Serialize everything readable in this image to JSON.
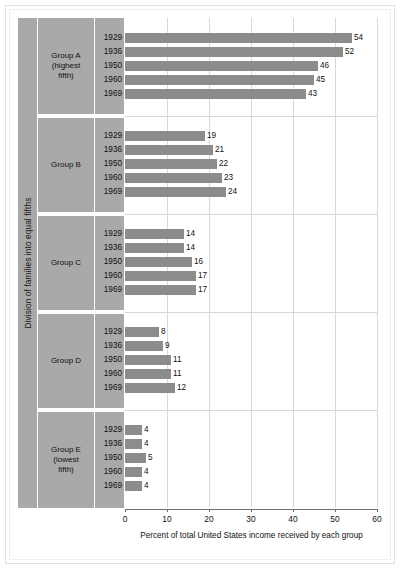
{
  "chart_data": {
    "type": "bar",
    "orientation": "horizontal",
    "title": "",
    "xlabel": "Percent of total United States income received by each group",
    "ylabel": "Division of families into equal fifths",
    "xlim": [
      0,
      60
    ],
    "xticks": [
      0,
      10,
      20,
      30,
      40,
      50,
      60
    ],
    "xtick_labels": [
      "0",
      "10",
      "20",
      "30",
      "40",
      "50",
      "60"
    ],
    "grid": true,
    "legend": "none",
    "bar_color": "#8c8c8c",
    "panel_color": "#a9a9a9",
    "groups": [
      {
        "name": "Group A (highest fifth)",
        "name_lines": [
          "Group A",
          "(highest",
          "fifth)"
        ],
        "categories": [
          "1929",
          "1936",
          "1950",
          "1960",
          "1969"
        ],
        "values": [
          54,
          52,
          46,
          45,
          43
        ]
      },
      {
        "name": "Group B",
        "name_lines": [
          "Group B"
        ],
        "categories": [
          "1929",
          "1936",
          "1950",
          "1960",
          "1969"
        ],
        "values": [
          19,
          21,
          22,
          23,
          24
        ]
      },
      {
        "name": "Group C",
        "name_lines": [
          "Group C"
        ],
        "categories": [
          "1929",
          "1936",
          "1950",
          "1960",
          "1969"
        ],
        "values": [
          14,
          14,
          16,
          17,
          17
        ]
      },
      {
        "name": "Group D",
        "name_lines": [
          "Group D"
        ],
        "categories": [
          "1929",
          "1936",
          "1950",
          "1960",
          "1969"
        ],
        "values": [
          8,
          9,
          11,
          11,
          12
        ]
      },
      {
        "name": "Group E (lowest fifth)",
        "name_lines": [
          "Group E",
          "(lowest",
          "fifth)"
        ],
        "categories": [
          "1929",
          "1936",
          "1950",
          "1960",
          "1969"
        ],
        "values": [
          4,
          4,
          5,
          4,
          4
        ]
      }
    ]
  }
}
